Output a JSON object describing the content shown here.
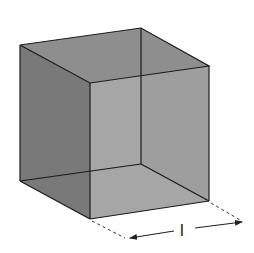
{
  "diagram": {
    "type": "cube",
    "dimension_label": "l",
    "fill_color": "#8a8a8a",
    "edge_color": "#1a1a1a",
    "faces": {
      "top": "#7d7d7d",
      "left": "#6e6e6e",
      "front": "#9a9a9a"
    }
  }
}
